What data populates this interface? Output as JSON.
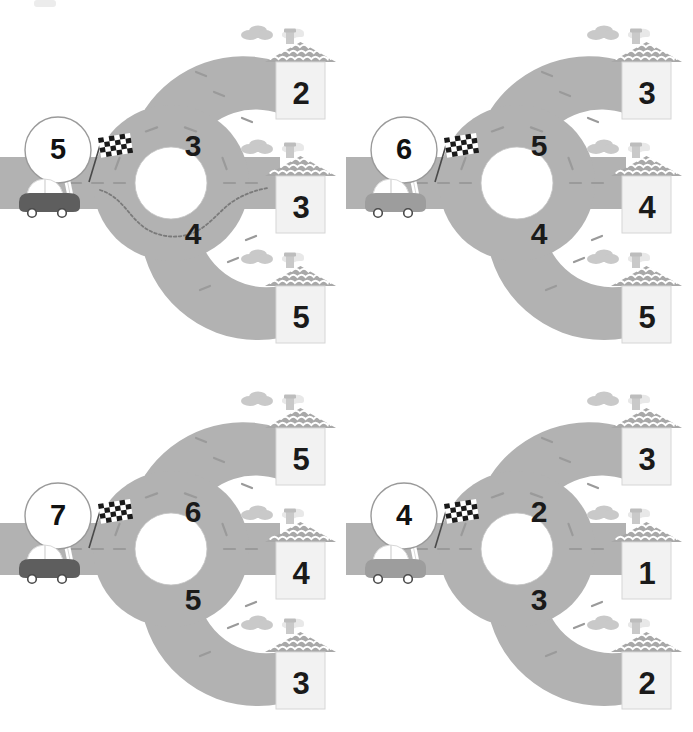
{
  "worksheet": {
    "type": "roundabout-number-puzzle-worksheet",
    "columns": 2,
    "rows": 2,
    "corner_mark": "faint-gray-marker",
    "colors": {
      "road": "#b2b2b2",
      "road_edge": "#a0a0a0",
      "road_dash": "#9a9a9a",
      "house_body": "#f2f2f2",
      "house_outline": "#d6d6d6",
      "roof": "#a8a8a8",
      "roof_pattern": "#ffffff",
      "chimney": "#c9c9c9",
      "cloud_dark": "#c9c9c9",
      "cloud_light": "#e8e8e8",
      "car_dark": "#5e5e5e",
      "car_light": "#9d9d9d",
      "flag_dark": "#1a1a1a",
      "flag_light": "#ffffff",
      "number": "#1a1a1a",
      "badge_fill": "#ffffff",
      "badge_stroke": "#9a9a9a",
      "trace_path": "#7a7a7a",
      "background": "#ffffff"
    },
    "icons": {
      "car": "car-icon",
      "flag": "checkered-flag-icon",
      "house": "house-icon",
      "cloud": "cloud-icon",
      "chimney": "chimney-icon",
      "roundabout": "roundabout-icon",
      "badge": "start-number-badge-icon",
      "trace": "dashed-route-trace-icon"
    },
    "puzzles": [
      {
        "id": "puzzle-1",
        "position": "top-left",
        "start_number": "5",
        "car_color": "dark",
        "ring_numbers": {
          "upper": "3",
          "lower": "4"
        },
        "houses": [
          {
            "slot": "top",
            "number": "2"
          },
          {
            "slot": "middle",
            "number": "3"
          },
          {
            "slot": "bottom",
            "number": "5"
          }
        ],
        "has_traced_route": true,
        "traced_route_target": "middle"
      },
      {
        "id": "puzzle-2",
        "position": "top-right",
        "start_number": "6",
        "car_color": "light",
        "ring_numbers": {
          "upper": "5",
          "lower": "4"
        },
        "houses": [
          {
            "slot": "top",
            "number": "3"
          },
          {
            "slot": "middle",
            "number": "4"
          },
          {
            "slot": "bottom",
            "number": "5"
          }
        ],
        "has_traced_route": false,
        "traced_route_target": ""
      },
      {
        "id": "puzzle-3",
        "position": "bottom-left",
        "start_number": "7",
        "car_color": "dark",
        "ring_numbers": {
          "upper": "6",
          "lower": "5"
        },
        "houses": [
          {
            "slot": "top",
            "number": "5"
          },
          {
            "slot": "middle",
            "number": "4"
          },
          {
            "slot": "bottom",
            "number": "3"
          }
        ],
        "has_traced_route": false,
        "traced_route_target": ""
      },
      {
        "id": "puzzle-4",
        "position": "bottom-right",
        "start_number": "4",
        "car_color": "light",
        "ring_numbers": {
          "upper": "2",
          "lower": "3"
        },
        "houses": [
          {
            "slot": "top",
            "number": "3"
          },
          {
            "slot": "middle",
            "number": "1"
          },
          {
            "slot": "bottom",
            "number": "2"
          }
        ],
        "has_traced_route": false,
        "traced_route_target": ""
      }
    ]
  }
}
